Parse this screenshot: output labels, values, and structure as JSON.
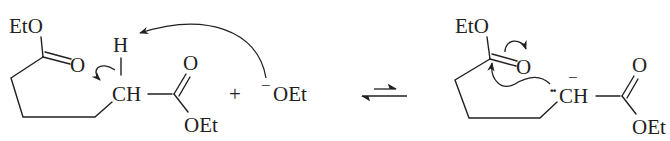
{
  "diagram": {
    "type": "reaction-scheme",
    "reactant": {
      "labels": {
        "ester_top": "EtO",
        "carbonyl_o_top": "O",
        "alpha_h": "H",
        "alpha_ch": "CH",
        "carbonyl_o_right": "O",
        "ester_right": "OEt"
      }
    },
    "plus": "+",
    "reagent": {
      "charge": "−",
      "label": "OEt"
    },
    "equilibrium_arrow": "⇌",
    "product": {
      "labels": {
        "ester_top": "EtO",
        "carbonyl_o_top": "O",
        "lone_pair": "··",
        "charge": "−",
        "carbanion_ch": "CH",
        "carbonyl_o_right": "O",
        "ester_right": "OEt"
      }
    },
    "colors": {
      "ink": "#231f20",
      "background": "#ffffff"
    }
  }
}
